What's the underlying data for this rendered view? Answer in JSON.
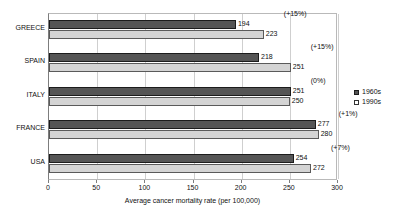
{
  "chart_data": {
    "type": "bar",
    "orientation": "horizontal",
    "title": "",
    "xlabel": "Average cancer mortality rate (per 100,000)",
    "ylabel": "",
    "xlim": [
      0,
      300
    ],
    "xticks": [
      0,
      50,
      100,
      150,
      200,
      250,
      300
    ],
    "xtick_labels": [
      "0",
      "50",
      "100",
      "150",
      "200",
      "250",
      "300"
    ],
    "grid": true,
    "grid_axis": "x",
    "legend_position": "right",
    "categories": [
      "GREECE",
      "SPAIN",
      "ITALY",
      "FRANCE",
      "USA"
    ],
    "series": [
      {
        "name": "1960s",
        "color": "#555555",
        "values": [
          194,
          218,
          251,
          277,
          254
        ],
        "value_labels": [
          "194",
          "218",
          "251",
          "277",
          "254"
        ]
      },
      {
        "name": "1990s",
        "color": "#d4d4d4",
        "values": [
          223,
          251,
          250,
          280,
          272
        ],
        "value_labels": [
          "223",
          "251",
          "250",
          "280",
          "272"
        ]
      }
    ],
    "annotations": [
      {
        "category": "GREECE",
        "text": "(+15%)"
      },
      {
        "category": "SPAIN",
        "text": "(+15%)"
      },
      {
        "category": "ITALY",
        "text": "(0%)"
      },
      {
        "category": "FRANCE",
        "text": "(+1%)"
      },
      {
        "category": "USA",
        "text": "(+7%)"
      }
    ]
  },
  "legend": {
    "items": [
      {
        "label": "1960s"
      },
      {
        "label": "1990s"
      }
    ]
  }
}
